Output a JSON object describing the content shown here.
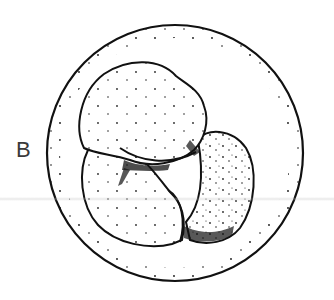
{
  "figure": {
    "panel_label": "B",
    "colors": {
      "ink": "#111111",
      "label": "#3a3a3a",
      "background": "#ffffff"
    },
    "outer_membrane": {
      "cx": 175,
      "cy": 153,
      "r": 128
    },
    "cells": [
      {
        "name": "top-cell"
      },
      {
        "name": "right-cell"
      },
      {
        "name": "left-bottom-cell"
      },
      {
        "name": "bottom-middle-cell"
      }
    ]
  }
}
